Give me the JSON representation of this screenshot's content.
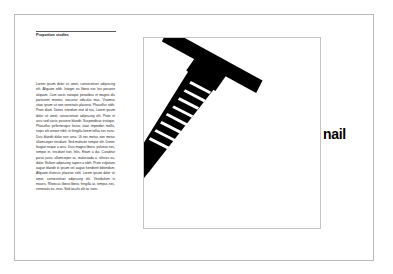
{
  "page": {
    "background_color": "#ffffff",
    "border_color": "#b9b9b9"
  },
  "left_column": {
    "rule_color": "#5a5a5a",
    "section_title": "Proportion studies",
    "body_text": "Lorem ipsum dolor sit amet, consectetuer adipiscing elit. Aliquam nibh. Integer eu libero nec leo posuere aliquam. Cum sociis natoque penatibus et magnis dis parturient montes, nascetur ridiculus mus. Vivamus vitae ipsum sit non venenatis placerat. Phasellus nibh. Proin diam. Donec interdum erat id nisi. Lorem ipsum dolor sit amet, consectetuer adipiscing elit. Proin et arcu sed sociis posuere blandit. Suspendisse tristique. Phasellus pellentesque lectus vitae imperdiet mollis, turpis elit ornare nibh, et fringilla lorem tellus nec nunc. Duis blandit dolor non urna. Ut nec metus non metus ullamcorper tincidunt. Sed molestie tempor elit. Donec feugiat neque a arcu. Duis magna libero, pulvinar nec, tempor et, tincidunt non, felis. Etiam a dui. Curabitur purus justo, ullamcorper ac, malesuada a, ultrices eu, dolor. Nullam adipiscing sapien a nibh. Proin vulputate augue blandit in ipsum vel augue hendrerit bibendum. Aliquam rhoncus placerat velit. Lorem ipsum dolor sit amet, consectetuer adipiscing elit. Vestibulum in mauris. Rhoncus libero libero, fringilla at, tempus nec, venenatis eu, eros. Sed iaculis elit ac nunc."
  },
  "illustration": {
    "frame_border_color": "#c4c4c4",
    "object_color": "#000000",
    "object_name": "nail",
    "ridge_count": 8,
    "rotation_degrees": 35
  },
  "caption": {
    "label": "nail",
    "color": "#000000"
  }
}
